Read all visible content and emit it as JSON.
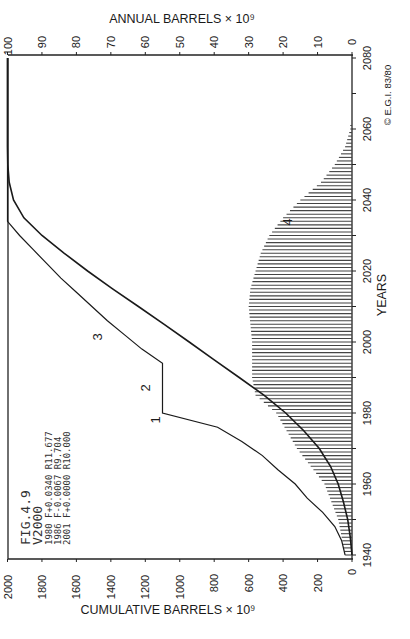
{
  "chart_data": {
    "type": "bar+line",
    "orientation": "rotated 90° counter-clockwise (years run along the right edge, bottom→top)",
    "title": "FIG.4.9",
    "subtitle": "V2000",
    "annotations": [
      "1980 F+0.0340 R11.677",
      "1986 F-0.0067 R9.704",
      "2001 F+0.0000 R10.000"
    ],
    "copyright": "© E.G.I. 83/80",
    "xlabel": "YEARS",
    "x_ticks": [
      1940,
      1960,
      1980,
      2000,
      2020,
      2040,
      2060,
      2080
    ],
    "x_range": [
      1940,
      2080
    ],
    "y_left_label": "CUMULATIVE  BARRELS × 10⁹",
    "y_left_ticks": [
      0,
      200,
      400,
      600,
      800,
      1000,
      1200,
      1400,
      1600,
      1800,
      2000
    ],
    "y_left_range": [
      0,
      2000
    ],
    "y_right_label": "ANNUAL  BARRELS × 10⁹",
    "y_right_ticks": [
      0,
      10,
      20,
      30,
      40,
      50,
      60,
      70,
      80,
      90,
      100
    ],
    "y_right_range": [
      0,
      100
    ],
    "curve_labels": [
      "1",
      "2",
      "3",
      "4"
    ],
    "series": [
      {
        "name": "Cumulative discovery (curve 1-2-3)",
        "axis": "cumulative",
        "type": "line",
        "x": [
          1940,
          1944,
          1948,
          1952,
          1956,
          1960,
          1964,
          1968,
          1972,
          1976,
          1980,
          1980,
          1994,
          1998,
          2002,
          2006,
          2010,
          2014,
          2018,
          2022,
          2026,
          2030,
          2034,
          2080
        ],
        "values": [
          40,
          60,
          100,
          170,
          260,
          330,
          430,
          520,
          640,
          780,
          1100,
          1100,
          1100,
          1220,
          1320,
          1420,
          1510,
          1600,
          1690,
          1770,
          1850,
          1930,
          2000,
          2000
        ]
      },
      {
        "name": "Cumulative production",
        "axis": "cumulative",
        "type": "line",
        "x": [
          1940,
          1945,
          1950,
          1955,
          1960,
          1965,
          1970,
          1975,
          1980,
          1985,
          1990,
          1995,
          2000,
          2005,
          2010,
          2015,
          2020,
          2025,
          2030,
          2035,
          2040,
          2045,
          2050,
          2055,
          2060,
          2080
        ],
        "values": [
          0,
          10,
          25,
          50,
          80,
          125,
          190,
          280,
          385,
          510,
          655,
          800,
          945,
          1090,
          1240,
          1390,
          1535,
          1670,
          1800,
          1905,
          1965,
          1990,
          1998,
          2000,
          2000,
          2000
        ]
      },
      {
        "name": "Annual production (curve 4)",
        "axis": "annual",
        "type": "bar",
        "x": [
          1940,
          1945,
          1950,
          1955,
          1960,
          1965,
          1970,
          1975,
          1980,
          1985,
          1990,
          1995,
          2000,
          2005,
          2010,
          2015,
          2020,
          2025,
          2030,
          2035,
          2040,
          2045,
          2050,
          2055,
          2060
        ],
        "values": [
          2,
          3,
          4,
          6,
          8,
          12,
          16,
          19,
          22,
          28,
          29,
          29,
          29,
          29.5,
          30,
          29.5,
          28,
          26.5,
          24,
          20,
          15,
          9,
          5,
          2,
          0.5
        ]
      }
    ],
    "grid": false,
    "legend": "none (curves labelled 1-4 in plot)"
  }
}
